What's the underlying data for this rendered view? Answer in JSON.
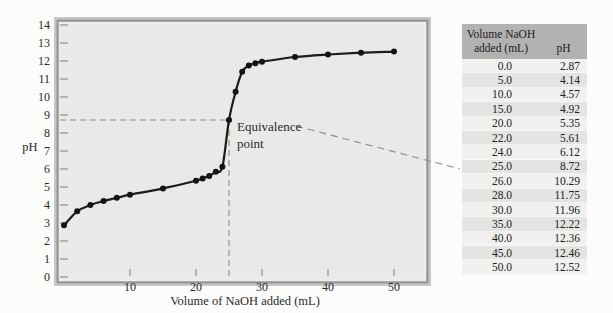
{
  "chart_data": {
    "type": "line",
    "title": "",
    "xlabel": "Volume of NaOH added (mL)",
    "ylabel": "pH",
    "xlim": [
      0,
      55
    ],
    "ylim": [
      0,
      14.2
    ],
    "xticks": [
      10,
      20,
      30,
      40,
      50
    ],
    "yticks": [
      0,
      1,
      2,
      3,
      4,
      5,
      6,
      7,
      8,
      9,
      10,
      11,
      12,
      13,
      14
    ],
    "grid": false,
    "legend": false,
    "series": [
      {
        "name": "titration curve (pH vs volume NaOH added)",
        "points": [
          [
            0,
            2.87
          ],
          [
            2,
            3.65
          ],
          [
            4,
            4.0
          ],
          [
            6,
            4.22
          ],
          [
            8,
            4.4
          ],
          [
            10,
            4.57
          ],
          [
            15,
            4.92
          ],
          [
            20,
            5.35
          ],
          [
            21,
            5.48
          ],
          [
            22,
            5.61
          ],
          [
            23,
            5.85
          ],
          [
            24,
            6.12
          ],
          [
            25,
            8.72
          ],
          [
            26,
            10.29
          ],
          [
            27,
            11.4
          ],
          [
            28,
            11.75
          ],
          [
            29,
            11.88
          ],
          [
            30,
            11.96
          ],
          [
            35,
            12.22
          ],
          [
            40,
            12.36
          ],
          [
            45,
            12.46
          ],
          [
            50,
            12.52
          ]
        ]
      }
    ],
    "equivalence_point": {
      "volume_mL": 25.0,
      "pH": 8.72
    },
    "annotation": {
      "lines": [
        "Equivalence",
        "point"
      ]
    }
  },
  "table": {
    "header": {
      "volume": "Volume NaOH\nadded (mL)",
      "ph": "pH"
    },
    "rows": [
      [
        "0.0",
        "2.87"
      ],
      [
        "5.0",
        "4.14"
      ],
      [
        "10.0",
        "4.57"
      ],
      [
        "15.0",
        "4.92"
      ],
      [
        "20.0",
        "5.35"
      ],
      [
        "22.0",
        "5.61"
      ],
      [
        "24.0",
        "6.12"
      ],
      [
        "25.0",
        "8.72"
      ],
      [
        "26.0",
        "10.29"
      ],
      [
        "28.0",
        "11.75"
      ],
      [
        "30.0",
        "11.96"
      ],
      [
        "35.0",
        "12.22"
      ],
      [
        "40.0",
        "12.36"
      ],
      [
        "45.0",
        "12.46"
      ],
      [
        "50.0",
        "12.52"
      ]
    ]
  },
  "colors": {
    "plot_bg": "#e9e9e7",
    "frame_outer": "#c6c6c4",
    "frame_main": "#969694",
    "frame_highlight": "#f4f4f2",
    "curve": "#1b1b1b",
    "dot": "#141414",
    "dash": "#8a8a88",
    "text": "#2b2b2b",
    "table_header_bg": "#b2b2b0",
    "row_odd": "#f0f0ee",
    "row_even": "#e4e4e2"
  }
}
